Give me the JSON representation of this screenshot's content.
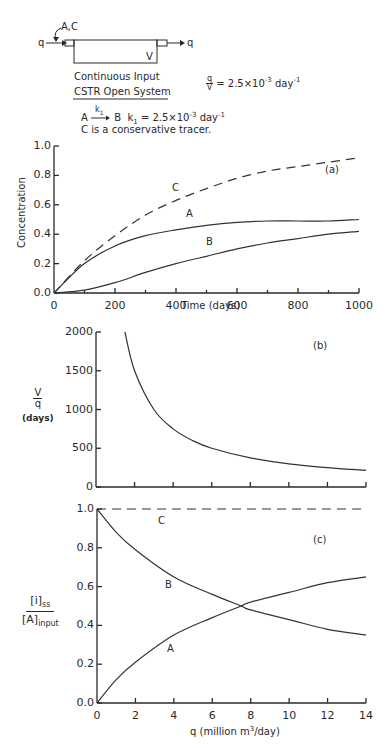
{
  "diagram": {
    "inflow_label": "q",
    "outflow_label": "q",
    "input_species": "A,C",
    "volume_label": "V",
    "subtitle_line1": "Continuous Input",
    "subtitle_line2": "CSTR Open System",
    "ratio_num": "q",
    "ratio_den": "V",
    "ratio_value": "= 2.5×10",
    "ratio_exp": "-3",
    "ratio_unit": " day",
    "ratio_unit_exp": "-1",
    "reaction_from": "A",
    "reaction_to": "B",
    "rate_const_symbol": "k",
    "rate_const_sub": "1",
    "rate_value": "= 2.5×10",
    "rate_exp": "-3",
    "rate_unit": " day",
    "rate_unit_exp": "-1",
    "tracer_note": "C is a conservative tracer."
  },
  "chart_data": [
    {
      "panel": "(a)",
      "type": "line",
      "title": "",
      "xlabel": "Time (days)",
      "ylabel": "Concentration",
      "xlim": [
        0,
        1000
      ],
      "ylim": [
        0,
        1.0
      ],
      "xticks": [
        "0",
        "200",
        "400",
        "600",
        "800",
        "1000"
      ],
      "yticks": [
        "0.0",
        "0.2",
        "0.4",
        "0.6",
        "0.8",
        "1.0"
      ],
      "grid": false,
      "x": [
        0,
        100,
        200,
        300,
        400,
        500,
        600,
        700,
        800,
        900,
        1000
      ],
      "series": [
        {
          "name": "C",
          "style": "dashed",
          "values": [
            0.0,
            0.22,
            0.39,
            0.53,
            0.63,
            0.71,
            0.78,
            0.83,
            0.86,
            0.89,
            0.92
          ]
        },
        {
          "name": "A",
          "style": "solid",
          "values": [
            0.0,
            0.2,
            0.32,
            0.39,
            0.43,
            0.46,
            0.48,
            0.49,
            0.49,
            0.49,
            0.5
          ]
        },
        {
          "name": "B",
          "style": "solid",
          "values": [
            0.0,
            0.02,
            0.07,
            0.14,
            0.2,
            0.25,
            0.3,
            0.34,
            0.37,
            0.4,
            0.42
          ]
        }
      ]
    },
    {
      "panel": "(b)",
      "type": "line",
      "xlabel": "",
      "ylabel_num": "V",
      "ylabel_den": "q",
      "ylabel_unit": "(days)",
      "xlim": [
        0,
        14
      ],
      "ylim": [
        0,
        2000
      ],
      "yticks": [
        "0",
        "500",
        "1000",
        "1500",
        "2000"
      ],
      "grid": false,
      "x": [
        1.5,
        2,
        3,
        4,
        5,
        6,
        8,
        10,
        12,
        14
      ],
      "series": [
        {
          "name": "V/q",
          "style": "solid",
          "values": [
            2000,
            1500,
            1000,
            750,
            600,
            500,
            375,
            300,
            250,
            214
          ]
        }
      ]
    },
    {
      "panel": "(c)",
      "type": "line",
      "xlabel": "q (million m³/day)",
      "ylabel": "[i]ss / [A]input",
      "xlim": [
        0,
        14
      ],
      "ylim": [
        0,
        1.0
      ],
      "xticks": [
        "0",
        "2",
        "4",
        "6",
        "8",
        "10",
        "12",
        "14"
      ],
      "yticks": [
        "0.0",
        "0.2",
        "0.4",
        "0.6",
        "0.8",
        "1.0"
      ],
      "grid": false,
      "x": [
        0,
        1,
        2,
        4,
        6,
        7.5,
        8,
        10,
        12,
        14
      ],
      "series": [
        {
          "name": "C",
          "style": "dashed",
          "values": [
            1.0,
            1.0,
            1.0,
            1.0,
            1.0,
            1.0,
            1.0,
            1.0,
            1.0,
            1.0
          ]
        },
        {
          "name": "B",
          "style": "solid",
          "values": [
            1.0,
            0.88,
            0.79,
            0.65,
            0.56,
            0.5,
            0.48,
            0.43,
            0.38,
            0.35
          ]
        },
        {
          "name": "A",
          "style": "solid",
          "values": [
            0.0,
            0.12,
            0.21,
            0.35,
            0.44,
            0.5,
            0.52,
            0.57,
            0.62,
            0.65
          ]
        }
      ]
    }
  ],
  "labels": {
    "a_panel": "(a)",
    "b_panel": "(b)",
    "c_panel": "(c)",
    "a_curve_C": "C",
    "a_curve_A": "A",
    "a_curve_B": "B",
    "c_curve_C": "C",
    "c_curve_B": "B",
    "c_curve_A": "A",
    "a_xlabel": "Time (days)",
    "a_ylabel": "Concentration",
    "b_ylabel_num": "V",
    "b_ylabel_den": "q",
    "b_ylabel_unit": "(days)",
    "c_ylabel_num_bracket": "i",
    "c_ylabel_num_sub": "ss",
    "c_ylabel_den_bracket": "A",
    "c_ylabel_den_sub": "input",
    "c_xlabel_pre": "q (million m",
    "c_xlabel_sup": "3",
    "c_xlabel_post": "/day)",
    "a_yticks": [
      "0.0",
      "0.2",
      "0.4",
      "0.6",
      "0.8",
      "1.0"
    ],
    "a_xticks": [
      "0",
      "200",
      "400",
      "600",
      "800",
      "1000"
    ],
    "b_yticks": [
      "0",
      "500",
      "1000",
      "1500",
      "2000"
    ],
    "c_yticks": [
      "0.0",
      "0.2",
      "0.4",
      "0.6",
      "0.8",
      "1.0"
    ],
    "c_xticks": [
      "0",
      "2",
      "4",
      "6",
      "8",
      "10",
      "12",
      "14"
    ]
  }
}
